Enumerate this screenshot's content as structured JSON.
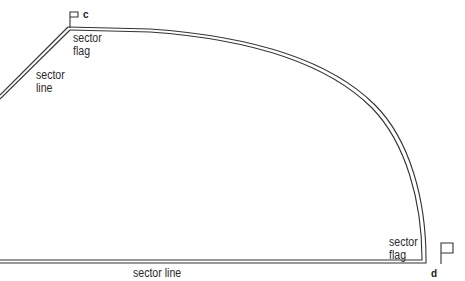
{
  "diagram": {
    "type": "sector boundary",
    "stroke_color": "#333333",
    "labels": {
      "sector_flag_c": "sector\nflag",
      "sector_line_left": "sector\nline",
      "sector_flag_d": "sector\nflag",
      "sector_line_bottom": "sector line"
    },
    "points": {
      "c": "c",
      "d": "d"
    }
  }
}
